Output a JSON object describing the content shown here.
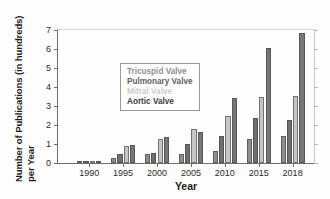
{
  "chart_data": {
    "type": "bar",
    "title": "",
    "xlabel": "Year",
    "ylabel_line1": "Number of Publications (in hundreds)",
    "ylabel_line2": "per Year",
    "categories": [
      "1990",
      "1995",
      "2000",
      "2005",
      "2010",
      "2015",
      "2018"
    ],
    "xlim_labels": [
      "1990",
      "1995",
      "2000",
      "2005",
      "2010",
      "2015",
      "2018"
    ],
    "ylim": [
      0,
      7
    ],
    "yticks": [
      0,
      1,
      2,
      3,
      4,
      5,
      6,
      7
    ],
    "ytick_labels": [
      "0",
      "1",
      "2",
      "3",
      "4",
      "5",
      "6",
      "7"
    ],
    "grid": false,
    "legend_position": "top-left",
    "series": [
      {
        "name": "Tricuspid Valve",
        "color": "#8e8e8e",
        "values": [
          0.05,
          0.25,
          0.45,
          0.45,
          0.65,
          1.25,
          1.4
        ]
      },
      {
        "name": "Pulmonary Valve",
        "color": "#6f6f6f",
        "values": [
          0.03,
          0.45,
          0.55,
          1.0,
          1.4,
          2.35,
          2.25
        ]
      },
      {
        "name": "Mitral Valve",
        "color": "#c6c6c6",
        "values": [
          0.1,
          0.9,
          1.25,
          1.8,
          2.5,
          3.5,
          3.55
        ]
      },
      {
        "name": "Aortic Valve",
        "color": "#767676",
        "values": [
          0.07,
          0.97,
          1.35,
          1.65,
          3.4,
          6.05,
          6.85
        ]
      }
    ]
  },
  "legend": {
    "entries": [
      {
        "label": "Tricuspid Valve",
        "color": "#8e8e8e"
      },
      {
        "label": "Pulmonary Valve",
        "color": "#5f5f5f"
      },
      {
        "label": "Mitral Valve",
        "color": "#cccccc"
      },
      {
        "label": "Aortic Valve",
        "color": "#3d3d3d"
      }
    ]
  }
}
